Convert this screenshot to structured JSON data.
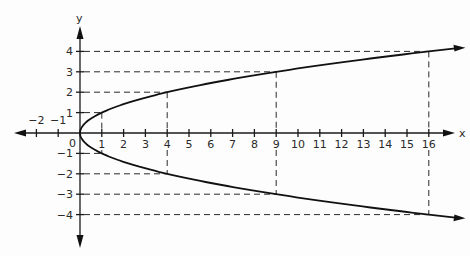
{
  "figure": {
    "equation_hint": "x = y^2",
    "axis_labels": {
      "x": "x",
      "y": "y"
    },
    "origin_label": "0",
    "x_ticks": [
      {
        "v": -2,
        "label": "−2"
      },
      {
        "v": -1,
        "label": "−1"
      },
      {
        "v": 1,
        "label": "1"
      },
      {
        "v": 2,
        "label": "2"
      },
      {
        "v": 3,
        "label": "3"
      },
      {
        "v": 4,
        "label": "4"
      },
      {
        "v": 5,
        "label": "5"
      },
      {
        "v": 6,
        "label": "6"
      },
      {
        "v": 7,
        "label": "7"
      },
      {
        "v": 8,
        "label": "8"
      },
      {
        "v": 9,
        "label": "9"
      },
      {
        "v": 10,
        "label": "10"
      },
      {
        "v": 11,
        "label": "11"
      },
      {
        "v": 12,
        "label": "12"
      },
      {
        "v": 13,
        "label": "13"
      },
      {
        "v": 14,
        "label": "14"
      },
      {
        "v": 15,
        "label": "15"
      },
      {
        "v": 16,
        "label": "16"
      }
    ],
    "y_ticks": [
      {
        "v": 4,
        "label": "4"
      },
      {
        "v": 3,
        "label": "3"
      },
      {
        "v": 2,
        "label": "2"
      },
      {
        "v": 1,
        "label": "1"
      },
      {
        "v": -1,
        "label": "−1"
      },
      {
        "v": -2,
        "label": "−2"
      },
      {
        "v": -3,
        "label": "−3"
      },
      {
        "v": -4,
        "label": "−4"
      }
    ],
    "highlighted_points": [
      {
        "x": 1,
        "y": 1
      },
      {
        "x": 4,
        "y": 2
      },
      {
        "x": 9,
        "y": 3
      },
      {
        "x": 16,
        "y": 4
      },
      {
        "x": 1,
        "y": -1
      },
      {
        "x": 4,
        "y": -2
      },
      {
        "x": 9,
        "y": -3
      },
      {
        "x": 16,
        "y": -4
      }
    ],
    "colors": {
      "line": "#111111",
      "background": "#fdfdfd"
    }
  }
}
